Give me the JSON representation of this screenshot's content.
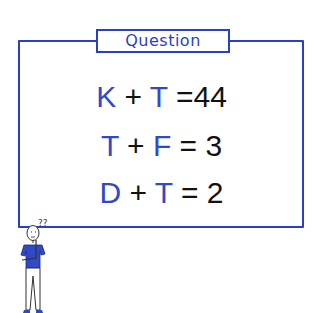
{
  "panel": {
    "label": "Question",
    "accent_color": "#2b3fc4"
  },
  "equations": [
    {
      "a": "K",
      "op": "+",
      "b": "T",
      "eq": "=",
      "result": "44"
    },
    {
      "a": "T",
      "op": "+",
      "b": "F",
      "eq": "=",
      "result": "3"
    },
    {
      "a": "D",
      "op": "+",
      "b": "T",
      "eq": "=",
      "result": "2"
    }
  ],
  "figure": {
    "thought": "??",
    "icon": "thinking-person-icon"
  }
}
